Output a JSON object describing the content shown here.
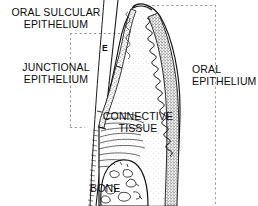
{
  "figure": {
    "kind": "anatomical-line-drawing",
    "background_color": "#ffffff",
    "ink_color": "#111111",
    "stipple_color": "#6e6e6e",
    "guide_color": "#9a9a9a",
    "width": 258,
    "height": 206
  },
  "labels": {
    "oral_sulcular_epithelium": "ORAL SULCULAR\nEPITHELIUM",
    "junctional_epithelium": "JUNCTIONAL\nEPITHELIUM",
    "oral_epithelium": "ORAL\nEPITHELIUM",
    "connective_tissue": "CONNECTIVE\nTISSUE",
    "bone": "BONE",
    "enamel_marker": "E"
  },
  "guides": {
    "note": "dashed leader lines delimiting the labelled tissue zones",
    "vertical_left_x": 70,
    "vertical_left_y1": 33,
    "vertical_left_y2": 128,
    "horizontal_upper_y": 33,
    "horizontal_upper_x1": 70,
    "horizontal_upper_x2": 121,
    "horizontal_top_y": 5,
    "horizontal_top_x1": 132,
    "horizontal_top_x2": 216,
    "vertical_right_x": 216,
    "vertical_right_y1": 5,
    "vertical_right_y2": 206,
    "horizontal_lower_y": 128,
    "horizontal_lower_x1": 70,
    "horizontal_lower_x2": 84
  }
}
